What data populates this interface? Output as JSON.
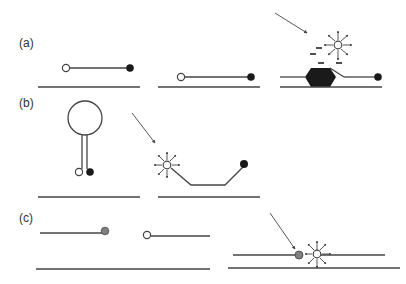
{
  "figure": {
    "panels": [
      {
        "id": "a",
        "label": "(a)"
      },
      {
        "id": "b",
        "label": "(b)"
      },
      {
        "id": "c",
        "label": "(c)"
      }
    ],
    "colors": {
      "ink": "#444444",
      "quencher": "#1a1a1a",
      "acceptor": "#808080",
      "fluorophore_fill": "#ffffff",
      "background": "#ffffff"
    },
    "elements": {
      "fluorophore": "open-circle",
      "quencher": "filled-black-circle",
      "acceptor": "filled-gray-circle",
      "excitation": "diagonal-arrow",
      "emission": "radiating-arrows",
      "charge_marks": "dashes",
      "protein": "black-hexagon"
    }
  }
}
